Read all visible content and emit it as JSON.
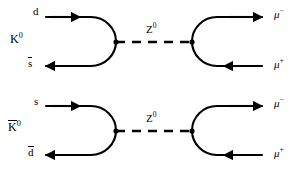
{
  "figure": {
    "kind": "feynman-diagram-pair",
    "background_color": "#ffffff",
    "line_color": "#000000"
  },
  "diagrams": [
    {
      "id": "kzero-decay",
      "meson_label": "K",
      "meson_charge": "0",
      "meson_overbar": false,
      "incoming_quark_label": "d",
      "outgoing_quark_label": "s",
      "outgoing_quark_overbar": true,
      "propagator_label": "Z",
      "propagator_charge": "0",
      "propagator_style": "dashed",
      "lepton_top_label": "μ",
      "lepton_top_charge": "−",
      "lepton_bottom_label": "μ",
      "lepton_bottom_charge": "+"
    },
    {
      "id": "kzero-bar-decay",
      "meson_label": "K",
      "meson_charge": "0",
      "meson_overbar": true,
      "incoming_quark_label": "s",
      "outgoing_quark_label": "d",
      "outgoing_quark_overbar": true,
      "propagator_label": "Z",
      "propagator_charge": "0",
      "propagator_style": "dashed",
      "lepton_top_label": "μ",
      "lepton_top_charge": "−",
      "lepton_bottom_label": "μ",
      "lepton_bottom_charge": "+"
    }
  ]
}
